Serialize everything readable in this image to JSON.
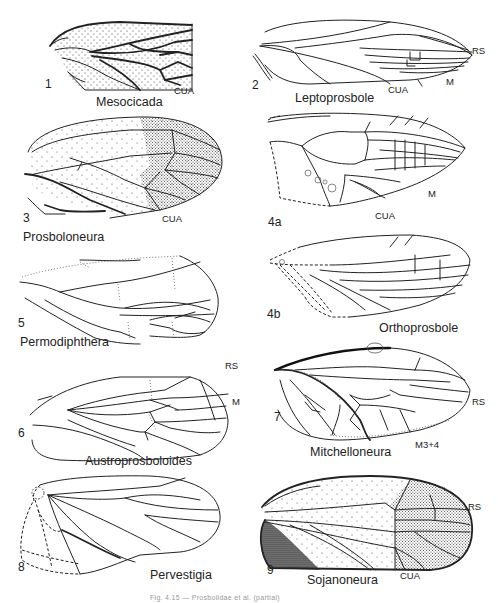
{
  "figure": {
    "caption": "Fig. 4.15 — Prosbolidae et al. (partial)",
    "panels": [
      {
        "number": "1",
        "genus": "Mesocicada",
        "vein_labels": [
          "CUA"
        ]
      },
      {
        "number": "2",
        "genus": "Leptoprosbole",
        "vein_labels": [
          "RS",
          "M",
          "CUA"
        ]
      },
      {
        "number": "3",
        "genus": "Prosboloneura",
        "vein_labels": [
          "CUA"
        ]
      },
      {
        "number": "4a",
        "genus": "Orthoprosbole",
        "vein_labels": [
          "M",
          "CUA"
        ]
      },
      {
        "number": "4b",
        "genus": "Orthoprosbole",
        "vein_labels": []
      },
      {
        "number": "5",
        "genus": "Permodiphthera",
        "vein_labels": []
      },
      {
        "number": "6",
        "genus": "Austroprosboloides",
        "vein_labels": [
          "RS",
          "M"
        ]
      },
      {
        "number": "7",
        "genus": "Mitchelloneura",
        "vein_labels": [
          "RS",
          "M3+4"
        ]
      },
      {
        "number": "8",
        "genus": "Pervestigia",
        "vein_labels": []
      },
      {
        "number": "9",
        "genus": "Sojanoneura",
        "vein_labels": [
          "RS",
          "CUA"
        ]
      }
    ]
  }
}
